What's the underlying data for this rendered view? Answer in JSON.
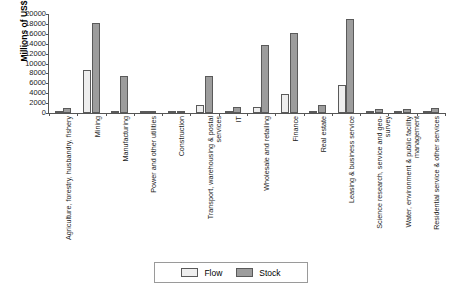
{
  "chart_data": {
    "type": "bar",
    "title": "",
    "xlabel": "",
    "ylabel": "Millions of US$",
    "ylim": [
      0,
      20000
    ],
    "yticks": [
      20000,
      18000,
      16000,
      14000,
      12000,
      10000,
      8000,
      6000,
      4000,
      2000,
      0
    ],
    "grid": false,
    "legend_position": "bottom-center",
    "categories": [
      "Agriculture, forestry, husbandry, fishery",
      "Mining",
      "Manufacturing",
      "Power and other utilities",
      "Construction",
      "Transport, warehousing & postal services",
      "IT",
      "Wholesale and retailing",
      "Finance",
      "Real estate",
      "Leasing & business service",
      "Science research, service and geo-survey",
      "Water, environment & public facility management",
      "Residential service & other services"
    ],
    "series": [
      {
        "name": "Flow",
        "color": "#efefef",
        "values": [
          300,
          8700,
          500,
          100,
          150,
          1700,
          200,
          1200,
          3800,
          400,
          5700,
          200,
          150,
          250
        ]
      },
      {
        "name": "Stock",
        "color": "#9d9d9d",
        "values": [
          950,
          18150,
          7400,
          400,
          300,
          7500,
          1200,
          13700,
          16200,
          1700,
          19000,
          900,
          900,
          1100
        ]
      }
    ]
  },
  "legend": {
    "items": [
      {
        "label": "Flow",
        "swatch": "flow"
      },
      {
        "label": "Stock",
        "swatch": "stock"
      }
    ]
  },
  "caption": ""
}
